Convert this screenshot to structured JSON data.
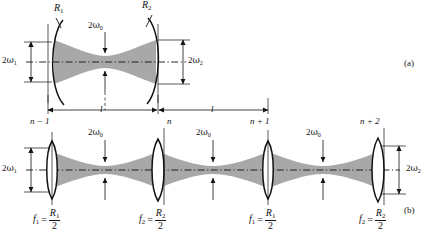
{
  "figure": {
    "background_color": "#ffffff",
    "beam_fill_color": "#a8a8a8",
    "line_color": "#121212",
    "width": 432,
    "height": 240
  },
  "panels": [
    {
      "id": "a",
      "tag": "(a)",
      "tag_x": 404,
      "tag_y": 58
    },
    {
      "id": "b",
      "tag": "(b)",
      "tag_x": 404,
      "tag_y": 207
    }
  ],
  "panel_a": {
    "mirrors": [
      {
        "name": "mirror-left",
        "label": "R",
        "sub": "1",
        "label_x": 54,
        "label_y": 8,
        "x": 52
      },
      {
        "name": "mirror-right",
        "label": "R",
        "sub": "2",
        "label_x": 146,
        "label_y": 5,
        "x": 158
      }
    ],
    "beam_labels": [
      {
        "name": "waist-diameter",
        "text": "2",
        "greek": "ω",
        "sub": "0",
        "x": 88,
        "y": 24
      },
      {
        "name": "spot-size-left",
        "text": "2",
        "greek": "ω",
        "sub": "1",
        "x": 3,
        "y": 52
      },
      {
        "name": "spot-size-right",
        "text": "2",
        "greek": "ω",
        "sub": "2",
        "x": 172,
        "y": 52
      }
    ],
    "dimensions": [
      {
        "name": "length-left",
        "label": "l",
        "x1": 48,
        "x2": 157,
        "label_x": 100,
        "y": 110
      },
      {
        "name": "length-right",
        "label": "l",
        "x1": 159,
        "x2": 268,
        "label_x": 211,
        "y": 110
      }
    ]
  },
  "panel_b": {
    "axis_y": 170,
    "lenses": [
      {
        "name": "lens-n-minus-1",
        "label": "n − 1",
        "x": 52,
        "label_x": 36,
        "label_y": 122,
        "focal": {
          "f": "f",
          "fsub": "1",
          "R": "R",
          "Rsub": "1",
          "den": "2"
        },
        "formula_x": 33,
        "formula_y": 210
      },
      {
        "name": "lens-n",
        "label": "n",
        "x": 158,
        "label_x": 160,
        "label_y": 122,
        "focal": {
          "f": "f",
          "fsub": "2",
          "R": "R",
          "Rsub": "2",
          "den": "2"
        },
        "formula_x": 139,
        "formula_y": 210
      },
      {
        "name": "lens-n-plus-1",
        "label": "n + 1",
        "x": 268,
        "label_x": 252,
        "label_y": 122,
        "focal": {
          "f": "f",
          "fsub": "1",
          "R": "R",
          "Rsub": "1",
          "den": "2"
        },
        "formula_x": 249,
        "formula_y": 210
      },
      {
        "name": "lens-n-plus-2",
        "label": "n + 2",
        "x": 378,
        "label_x": 362,
        "label_y": 122,
        "focal": {
          "f": "f",
          "fsub": "2",
          "R": "R",
          "Rsub": "2",
          "den": "2"
        },
        "formula_x": 359,
        "formula_y": 210
      }
    ],
    "waist_labels": [
      {
        "name": "waist-diameter-1",
        "text": "2",
        "greek": "ω",
        "sub": "0",
        "x": 90,
        "y": 130
      },
      {
        "name": "waist-diameter-2",
        "text": "2",
        "greek": "ω",
        "sub": "0",
        "x": 200,
        "y": 130
      },
      {
        "name": "waist-diameter-3",
        "text": "2",
        "greek": "ω",
        "sub": "0",
        "x": 310,
        "y": 130
      }
    ],
    "spot_labels": [
      {
        "name": "spot-size-left",
        "text": "2",
        "greek": "ω",
        "sub": "1",
        "x": 3,
        "y": 163
      },
      {
        "name": "spot-size-right",
        "text": "2",
        "greek": "ω",
        "sub": "2",
        "x": 404,
        "y": 163
      }
    ],
    "waist_x_positions": [
      105,
      213,
      323
    ]
  },
  "symbols": {
    "omega": "ω",
    "minus": "−"
  }
}
